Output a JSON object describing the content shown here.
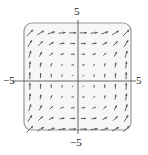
{
  "chart_data": {
    "type": "quiver",
    "title": "",
    "xlabel": "",
    "ylabel": "",
    "xlim": [
      -5,
      5
    ],
    "ylim": [
      -5,
      5
    ],
    "grid": false,
    "frame": "rounded-box",
    "tick_labels": {
      "x_left": "−5",
      "x_right": "5",
      "y_top": "5",
      "y_bottom": "−5"
    },
    "field_formula": "F(x, y) = (y^2, x^2)",
    "grid_points_x": [
      -4.5,
      -3.5,
      -2.5,
      -1.5,
      -0.5,
      0.5,
      1.5,
      2.5,
      3.5,
      4.5
    ],
    "grid_points_y": [
      -4.5,
      -3.5,
      -2.5,
      -1.5,
      -0.5,
      0.5,
      1.5,
      2.5,
      3.5,
      4.5
    ]
  },
  "colors": {
    "arrow": "#555555",
    "axis": "#444444",
    "frame": "#9a9a9a",
    "fill": "#f6f6f6"
  }
}
